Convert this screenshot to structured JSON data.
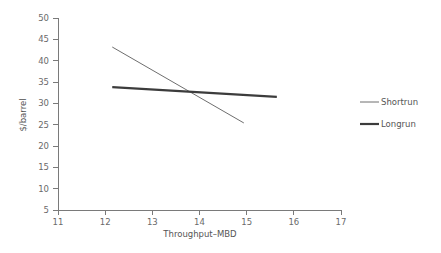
{
  "chart_data": {
    "type": "line",
    "title": "",
    "xlabel": "Throughput–MBD",
    "ylabel": "$/barrel",
    "xlim": [
      11,
      17
    ],
    "ylim": [
      5,
      50
    ],
    "xticks": [
      11,
      12,
      13,
      14,
      15,
      16,
      17
    ],
    "yticks": [
      5,
      10,
      15,
      20,
      25,
      30,
      35,
      40,
      45,
      50
    ],
    "xtick_labels": [
      "11",
      "12",
      "13",
      "14",
      "15",
      "16",
      "17"
    ],
    "ytick_labels": [
      "5",
      "10",
      "15",
      "20",
      "25",
      "30",
      "35",
      "40",
      "45",
      "50"
    ],
    "grid": false,
    "legend_position": "right",
    "series": [
      {
        "name": "Shortrun",
        "color": "#6e6e6e",
        "line_width": 1,
        "x": [
          12.15,
          14.94
        ],
        "y": [
          43.2,
          25.4
        ]
      },
      {
        "name": "Longrun",
        "color": "#3c3c3c",
        "line_width": 2.2,
        "x": [
          12.15,
          15.64
        ],
        "y": [
          33.8,
          31.5
        ]
      }
    ]
  },
  "legend": {
    "entries": [
      {
        "label": "Shortrun"
      },
      {
        "label": "Longrun"
      }
    ]
  },
  "colors": {
    "axis": "#7a7a7a",
    "text": "#555555",
    "tick_text": "#6a6a6a",
    "shortrun": "#6e6e6e",
    "longrun": "#3c3c3c",
    "background": "#ffffff"
  }
}
